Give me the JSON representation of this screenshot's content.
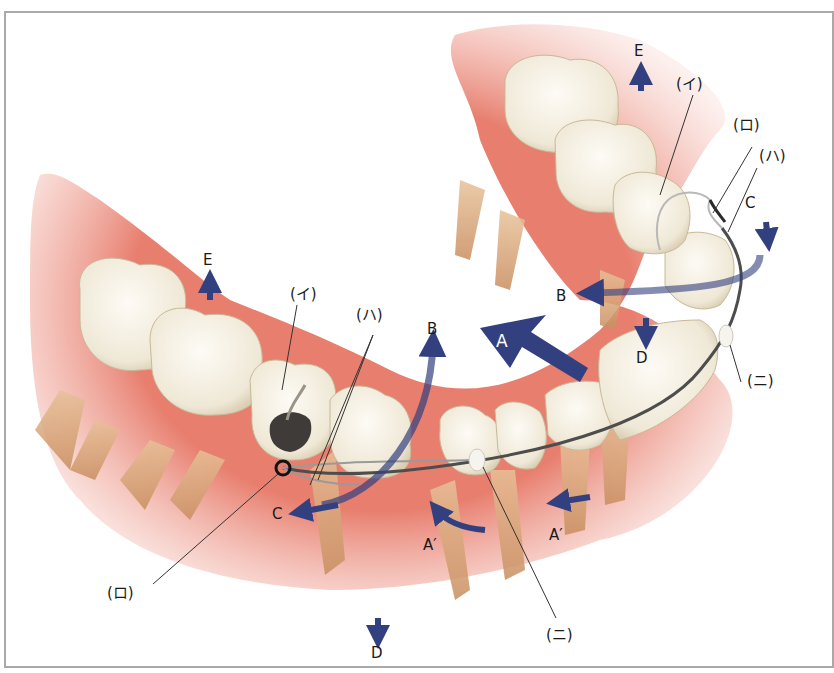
{
  "figure": {
    "type": "dental illustration",
    "colors": {
      "arrow": "#33407f",
      "gum": "#e5705e",
      "tooth": "#f3ede0",
      "root": "#d9a77a",
      "wire": "#555555",
      "frame": "#a9a9a9"
    }
  },
  "labels": {
    "part_i_upper": "(イ)",
    "part_ro_upper": "(ロ)",
    "part_ha_upper": "(ハ)",
    "part_ni_right": "(ニ)",
    "part_i_left": "(イ)",
    "part_ha_left": "(ハ)",
    "part_ro_bottom": "(ロ)",
    "part_ni_bottom": "(ニ)"
  },
  "arrows": {
    "A": "A",
    "A_prime_1": "A′",
    "A_prime_2": "A′",
    "B_right": "B",
    "B_left": "B",
    "C_right": "C",
    "C_left": "C",
    "D_right": "D",
    "D_bottom": "D",
    "E_top": "E",
    "E_left": "E"
  }
}
